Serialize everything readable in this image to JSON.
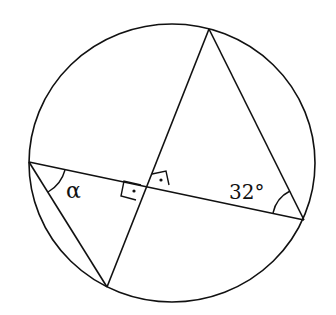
{
  "diagram": {
    "type": "circle-geometry",
    "labels": {
      "alpha": "α",
      "angle_right": "32°"
    },
    "points": {
      "top": [
        209,
        29
      ],
      "left": [
        29,
        162
      ],
      "right": [
        304,
        220
      ],
      "bottom": [
        107,
        287
      ],
      "intersection": [
        147,
        187
      ]
    },
    "circle": {
      "cx": 172,
      "cy": 163,
      "r": 142
    },
    "colors": {
      "stroke": "#111111",
      "background": "#ffffff"
    }
  }
}
